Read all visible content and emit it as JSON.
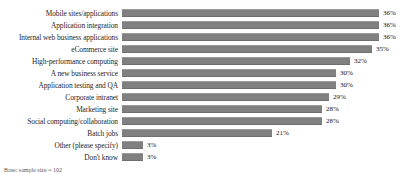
{
  "chart_data": {
    "type": "bar",
    "orientation": "horizontal",
    "title": "",
    "subtitle": "",
    "xlabel": "",
    "ylabel": "",
    "grid": false,
    "legend": null,
    "axis_visible": false,
    "xlim": [
      0,
      36
    ],
    "value_suffix": "%",
    "categories": [
      "Mobile sites/applications",
      "Application integration",
      "Internal web business applications",
      "eCommerce site",
      "High-performance computing",
      "A new business service",
      "Application testing and QA",
      "Corporate intranet",
      "Marketing site",
      "Social computing/collaboration",
      "Batch jobs",
      "Other (please specify)",
      "Don't know"
    ],
    "values": [
      36,
      36,
      36,
      35,
      32,
      30,
      30,
      29,
      28,
      28,
      21,
      3,
      3
    ],
    "value_labels": [
      "36%",
      "36%",
      "36%",
      "35%",
      "32%",
      "30%",
      "30%",
      "29%",
      "28%",
      "28%",
      "21%",
      "3%",
      "3%"
    ],
    "bar_color": "#808080"
  },
  "footnote": {
    "text": "Base: sample size = 102"
  }
}
